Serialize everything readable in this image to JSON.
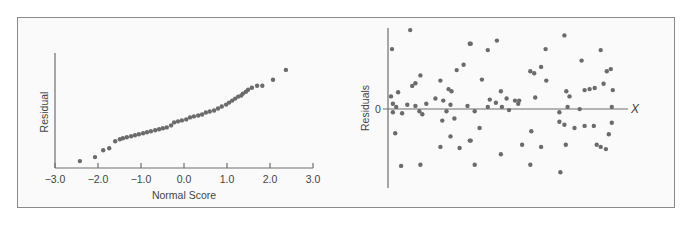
{
  "chart_data": [
    {
      "id": "normal-probability-plot",
      "type": "scatter",
      "title": "",
      "xlabel": "Normal Score",
      "ylabel": "Residual",
      "xlim": [
        -3.0,
        3.0
      ],
      "x_ticks": [
        -3.0,
        -2.0,
        -1.0,
        0.0,
        1.0,
        2.0,
        3.0
      ],
      "x_tick_labels": [
        "−3.0",
        "−2.0",
        "−1.0",
        "0.0",
        "1.0",
        "2.0",
        "3.0"
      ],
      "y_ticks": [],
      "ylim": [
        -1.2,
        4.6
      ],
      "grid": false,
      "legend": null,
      "point_color": "#6b6b6b",
      "points": [
        [
          -2.42,
          -0.85
        ],
        [
          -2.07,
          -0.65
        ],
        [
          -1.88,
          -0.3
        ],
        [
          -1.74,
          -0.2
        ],
        [
          -1.6,
          0.15
        ],
        [
          -1.49,
          0.25
        ],
        [
          -1.42,
          0.3
        ],
        [
          -1.33,
          0.35
        ],
        [
          -1.23,
          0.4
        ],
        [
          -1.14,
          0.45
        ],
        [
          -1.05,
          0.5
        ],
        [
          -0.95,
          0.55
        ],
        [
          -0.86,
          0.6
        ],
        [
          -0.77,
          0.65
        ],
        [
          -0.67,
          0.7
        ],
        [
          -0.58,
          0.75
        ],
        [
          -0.49,
          0.8
        ],
        [
          -0.4,
          0.85
        ],
        [
          -0.3,
          0.95
        ],
        [
          -0.23,
          1.1
        ],
        [
          -0.14,
          1.15
        ],
        [
          -0.05,
          1.2
        ],
        [
          0.05,
          1.25
        ],
        [
          0.14,
          1.35
        ],
        [
          0.23,
          1.4
        ],
        [
          0.33,
          1.45
        ],
        [
          0.42,
          1.5
        ],
        [
          0.51,
          1.6
        ],
        [
          0.6,
          1.65
        ],
        [
          0.7,
          1.7
        ],
        [
          0.79,
          1.8
        ],
        [
          0.88,
          1.9
        ],
        [
          0.98,
          2.0
        ],
        [
          1.05,
          2.1
        ],
        [
          1.12,
          2.2
        ],
        [
          1.19,
          2.3
        ],
        [
          1.26,
          2.4
        ],
        [
          1.33,
          2.45
        ],
        [
          1.37,
          2.55
        ],
        [
          1.44,
          2.65
        ],
        [
          1.49,
          2.75
        ],
        [
          1.58,
          2.85
        ],
        [
          1.7,
          2.95
        ],
        [
          1.82,
          2.95
        ],
        [
          2.07,
          3.25
        ],
        [
          2.37,
          3.75
        ]
      ]
    },
    {
      "id": "residuals-vs-x",
      "type": "scatter",
      "title": "",
      "xlabel": "X",
      "ylabel": "Residuals",
      "y_tick_labels": [
        "0"
      ],
      "xlim": [
        0,
        100
      ],
      "ylim": [
        -4.0,
        3.6
      ],
      "zero_line": true,
      "grid": false,
      "legend": null,
      "point_color": "#6b6b6b",
      "points": [
        [
          1.6,
          2.6
        ],
        [
          9.0,
          3.5
        ],
        [
          1.2,
          0.35
        ],
        [
          4.1,
          0.55
        ],
        [
          2.0,
          0.0
        ],
        [
          3.3,
          -0.15
        ],
        [
          2.0,
          -0.4
        ],
        [
          5.7,
          -0.45
        ],
        [
          2.9,
          -1.4
        ],
        [
          5.3,
          -2.95
        ],
        [
          7.8,
          -0.05
        ],
        [
          9.8,
          0.85
        ],
        [
          11.1,
          0.98
        ],
        [
          13.1,
          1.35
        ],
        [
          11.1,
          -0.1
        ],
        [
          12.7,
          -0.35
        ],
        [
          13.9,
          -0.5
        ],
        [
          13.1,
          -2.9
        ],
        [
          15.5,
          0.0
        ],
        [
          19.2,
          0.25
        ],
        [
          21.2,
          1.1
        ],
        [
          22.4,
          0.15
        ],
        [
          23.7,
          -0.35
        ],
        [
          22.0,
          -0.8
        ],
        [
          24.5,
          0.7
        ],
        [
          25.7,
          0.6
        ],
        [
          25.3,
          -0.05
        ],
        [
          26.9,
          -0.7
        ],
        [
          25.3,
          -1.55
        ],
        [
          21.2,
          -2.05
        ],
        [
          27.8,
          1.6
        ],
        [
          29.0,
          -2.1
        ],
        [
          30.6,
          1.85
        ],
        [
          32.2,
          -0.1
        ],
        [
          33.1,
          2.85
        ],
        [
          33.1,
          -1.75
        ],
        [
          33.5,
          2.85
        ],
        [
          38.0,
          1.15
        ],
        [
          40.4,
          2.55
        ],
        [
          44.1,
          3.0
        ],
        [
          41.2,
          0.2
        ],
        [
          45.7,
          0.6
        ],
        [
          48.0,
          0.25
        ],
        [
          51.4,
          0.15
        ],
        [
          53.1,
          0.15
        ],
        [
          52.7,
          0.0
        ],
        [
          40.4,
          -0.15
        ],
        [
          49.0,
          -0.3
        ],
        [
          35.1,
          -0.35
        ],
        [
          37.1,
          -1.15
        ],
        [
          33.5,
          -1.75
        ],
        [
          45.7,
          -2.4
        ],
        [
          35.1,
          -2.9
        ],
        [
          54.3,
          -1.95
        ],
        [
          57.6,
          1.55
        ],
        [
          59.2,
          1.45
        ],
        [
          62.0,
          1.75
        ],
        [
          64.1,
          1.1
        ],
        [
          59.6,
          0.3
        ],
        [
          58.0,
          -1.3
        ],
        [
          62.0,
          -2.05
        ],
        [
          69.8,
          -3.25
        ],
        [
          71.4,
          3.25
        ],
        [
          63.8,
          2.6
        ],
        [
          78.4,
          2.05
        ],
        [
          72.2,
          0.6
        ],
        [
          73.5,
          0.35
        ],
        [
          79.6,
          0.65
        ],
        [
          81.6,
          0.7
        ],
        [
          83.7,
          0.75
        ],
        [
          72.7,
          -0.15
        ],
        [
          77.6,
          -0.25
        ],
        [
          69.4,
          -0.4
        ],
        [
          69.4,
          -0.85
        ],
        [
          71.4,
          -1.0
        ],
        [
          79.6,
          -1.05
        ],
        [
          86.1,
          2.55
        ],
        [
          90.2,
          1.65
        ],
        [
          88.6,
          1.55
        ],
        [
          87.3,
          0.95
        ],
        [
          91.0,
          0.65
        ],
        [
          90.6,
          -0.15
        ],
        [
          75.5,
          -1.15
        ],
        [
          72.0,
          -1.95
        ],
        [
          84.5,
          -1.95
        ],
        [
          83.3,
          -1.05
        ],
        [
          88.2,
          -2.15
        ],
        [
          90.6,
          -0.9
        ],
        [
          89.4,
          -1.45
        ],
        [
          86.1,
          -2.05
        ],
        [
          57.6,
          -2.9
        ],
        [
          43.7,
          0.05
        ],
        [
          46.1,
          -0.15
        ]
      ]
    }
  ]
}
